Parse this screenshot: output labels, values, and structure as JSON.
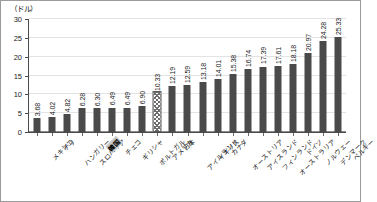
{
  "chart_data": {
    "type": "bar",
    "title": "",
    "subtitle": "",
    "xlabel": "",
    "ylabel": "",
    "unit_caption": "（ドル）",
    "ylim": [
      0,
      30
    ],
    "ytick_values": [
      0,
      5,
      10,
      15,
      20,
      25,
      30
    ],
    "ytick_labels": [
      "0",
      "5",
      "10",
      "15",
      "20",
      "25",
      "30"
    ],
    "grid": true,
    "legend": "none",
    "categories": [
      "メキシコ",
      "チリ",
      "ハンガリー",
      "スロバキア",
      "韓国",
      "チェコ",
      "ギリシャ",
      "ポルトガル",
      "アメリカ",
      "日本",
      "アイルランド",
      "イギリス",
      "カナダ",
      "オーストリア",
      "アイスランド",
      "フィンランド",
      "オーストラリア",
      "ドイツ",
      "ノルウェー",
      "デンマーク",
      "ベルギー"
    ],
    "values": [
      3.68,
      4.02,
      4.82,
      6.28,
      6.3,
      6.49,
      6.49,
      6.9,
      10.33,
      12.19,
      12.59,
      13.18,
      14.01,
      15.38,
      16.74,
      17.39,
      17.61,
      18.18,
      20.97,
      24.28,
      25.33
    ],
    "value_labels": [
      "3.68",
      "4.02",
      "4.82",
      "6.28",
      "6.30",
      "6.49",
      "6.49",
      "6.90",
      "10.33",
      "12.19",
      "12.59",
      "13.18",
      "14.01",
      "15.38",
      "16.74",
      "17.39",
      "17.61",
      "18.18",
      "20.97",
      "24.28",
      "25.33"
    ],
    "highlight_category": "韓国",
    "hatched_category": "アメリカ",
    "colors": {
      "bar": "#4a4a4a",
      "hatch_line": "#6e6e6e",
      "grid": "#e3e3e3",
      "axis": "#4a4a4a",
      "frame": "#9b9b9b",
      "text": "#1a1a1a",
      "highlight_bg": "#c9c9c9"
    }
  }
}
